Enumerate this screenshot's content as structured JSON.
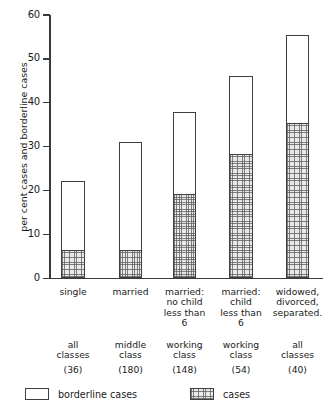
{
  "chart_data": {
    "type": "bar",
    "stacked": true,
    "title": "",
    "xlabel": "",
    "ylabel": "per cent cases and borderline cases",
    "ylim": [
      0,
      60
    ],
    "yticks": [
      0,
      10,
      20,
      30,
      40,
      50,
      60
    ],
    "ytick_labels": [
      "0",
      "10",
      "20",
      "30",
      "40",
      "50",
      "60"
    ],
    "grid": false,
    "legend_position": "bottom",
    "categories": [
      "single",
      "married",
      "married:\nno child\nless than\n6",
      "married:\nchild\nless than\n6",
      "widowed,\ndivorced,\nseparated."
    ],
    "category_lines": [
      [
        "single"
      ],
      [
        "married"
      ],
      [
        "married:",
        "no child",
        "less than",
        "6"
      ],
      [
        "married:",
        "child",
        "less than",
        "6"
      ],
      [
        "widowed,",
        "divorced,",
        "separated."
      ]
    ],
    "social_class": [
      [
        "all",
        "classes"
      ],
      [
        "middle",
        "class"
      ],
      [
        "working",
        "class"
      ],
      [
        "working",
        "class"
      ],
      [
        "all",
        "classes"
      ]
    ],
    "sample_sizes": [
      "(36)",
      "(180)",
      "(148)",
      "(54)",
      "(40)"
    ],
    "series": [
      {
        "name": "cases",
        "values": [
          6.2,
          6.2,
          19.0,
          28.0,
          35.0
        ]
      },
      {
        "name": "borderline cases",
        "values": [
          16.0,
          24.8,
          19.0,
          18.0,
          20.5
        ]
      }
    ],
    "totals": [
      22.2,
      31.0,
      38.0,
      46.0,
      55.5
    ],
    "colors": {
      "cases_fill": "#e9e9e9",
      "borderline_fill": "#ffffff",
      "outline": "#3f3f3f",
      "axis": "#3a3a3a",
      "text": "#1a1a1a"
    }
  },
  "legend": {
    "items": [
      {
        "label": "borderline cases",
        "style": "borderline"
      },
      {
        "label": "cases",
        "style": "cases"
      }
    ]
  }
}
